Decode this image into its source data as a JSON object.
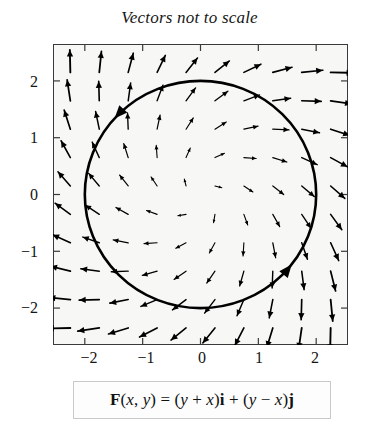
{
  "figure": {
    "title": "Vectors not to scale",
    "equation_plain": "F(x, y) = (y + x)i + (y - x)j",
    "equation_parts": {
      "F": "F",
      "open_args": "(",
      "x": "x",
      "comma": ", ",
      "y": "y",
      "close_args": ")",
      "equals": " = ",
      "term1_open": "(",
      "term1_a": "y",
      "term1_op": " + ",
      "term1_b": "x",
      "term1_close": ")",
      "i_hat": "i",
      "plus": " + ",
      "term2_open": "(",
      "term2_a": "y",
      "term2_op": " − ",
      "term2_b": "x",
      "term2_close": ")",
      "j_hat": "j"
    }
  },
  "chart_data": {
    "type": "scatter",
    "title": "Vectors not to scale",
    "subtitle": "",
    "xlabel": "",
    "ylabel": "",
    "xlim": [
      -2.55,
      2.55
    ],
    "ylim": [
      -2.65,
      2.65
    ],
    "xticks": [
      -2,
      -1,
      0,
      1,
      2
    ],
    "yticks": [
      -2,
      -1,
      0,
      1,
      2
    ],
    "xticklabels": [
      "−2",
      "−1",
      "0",
      "1",
      "2"
    ],
    "yticklabels": [
      "−2",
      "−1",
      "0",
      "1",
      "2"
    ],
    "grid": false,
    "legend": "none",
    "plot_kind": "vector-field-with-curve",
    "field": {
      "formula": "F(x, y) = (y + x)i + (y - x)j",
      "i_component": "y + x",
      "j_component": "y - x",
      "grid_x": [
        -2.25,
        -1.75,
        -1.25,
        -0.75,
        -0.25,
        0.25,
        0.75,
        1.25,
        1.75,
        2.25
      ],
      "grid_y": [
        -2.35,
        -1.85,
        -1.35,
        -0.85,
        -0.35,
        0.15,
        0.65,
        1.15,
        1.65,
        2.15
      ],
      "arrow_scale_note": "vectors drawn with compressed (non-linear) length",
      "arrow_color": "#000000"
    },
    "curve": {
      "name": "circle",
      "equation": "x^2 + y^2 = 4",
      "center": [
        0,
        0
      ],
      "radius": 2,
      "orientation": "counterclockwise",
      "stroke_width": 2.6,
      "color": "#000000",
      "arrowheads_at_angles_deg": [
        138,
        -38
      ]
    },
    "frame_color": "#3a3a3a",
    "plot_background": "#f7f7f5"
  }
}
